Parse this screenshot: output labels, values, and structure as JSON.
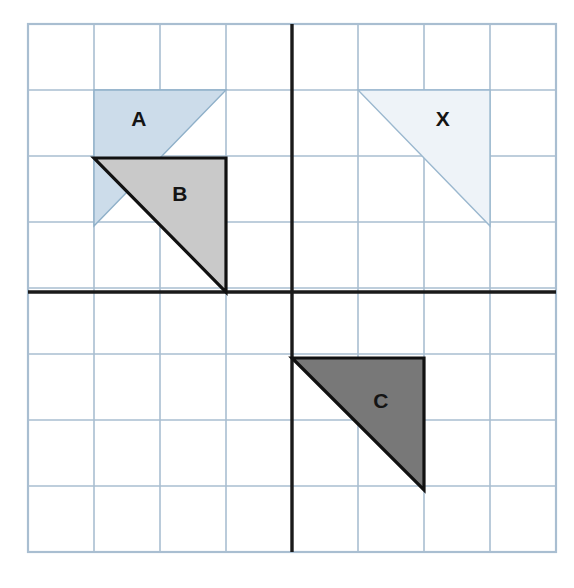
{
  "diagram": {
    "type": "geometry-grid",
    "grid": {
      "columns": 8,
      "rows": 8,
      "cell_size_px": 66,
      "left_px": 28,
      "top_px": 24,
      "right_px": 556,
      "bottom_px": 552,
      "origin_x_px": 292,
      "origin_y_px": 292,
      "grid_line_color": "#a9bed1",
      "axis_color": "#1a1a1a",
      "border_color": "#a9bed1",
      "background_color": "#ffffff",
      "x_range": [
        -4,
        4
      ],
      "y_range": [
        -4,
        4
      ]
    },
    "shapes": [
      {
        "id": "triangle-a",
        "label": "A",
        "fill": "#ccdcea",
        "stroke": "#8fb0c9",
        "stroke_width": 1.4,
        "label_px": [
          139,
          118
        ],
        "vertices_px": [
          [
            94,
            90
          ],
          [
            226,
            90
          ],
          [
            94,
            226
          ]
        ],
        "vertices_grid": [
          [
            -3,
            3
          ],
          [
            -1,
            3
          ],
          [
            -3,
            1
          ]
        ],
        "right_angle_at": "top-left"
      },
      {
        "id": "triangle-x",
        "label": "X",
        "fill": "#eef3f8",
        "stroke": "#9bb8cf",
        "stroke_width": 1.4,
        "label_px": [
          443,
          118
        ],
        "vertices_px": [
          [
            358,
            90
          ],
          [
            490,
            90
          ],
          [
            490,
            226
          ]
        ],
        "vertices_grid": [
          [
            1,
            3
          ],
          [
            3,
            3
          ],
          [
            3,
            1
          ]
        ],
        "right_angle_at": "top-right"
      },
      {
        "id": "triangle-b",
        "label": "B",
        "fill": "#c9c9c9",
        "stroke": "#111111",
        "stroke_width": 3.2,
        "label_px": [
          180,
          193
        ],
        "vertices_px": [
          [
            94,
            158
          ],
          [
            226,
            158
          ],
          [
            226,
            292
          ]
        ],
        "vertices_grid": [
          [
            -3,
            2
          ],
          [
            -1,
            2
          ],
          [
            -1,
            0
          ]
        ],
        "right_angle_at": "top-right"
      },
      {
        "id": "triangle-c",
        "label": "C",
        "fill": "#787878",
        "stroke": "#111111",
        "stroke_width": 3.2,
        "label_px": [
          381,
          400
        ],
        "vertices_px": [
          [
            292,
            358
          ],
          [
            424,
            358
          ],
          [
            424,
            490
          ]
        ],
        "vertices_grid": [
          [
            0,
            -1
          ],
          [
            2,
            -1
          ],
          [
            2,
            -3
          ]
        ],
        "right_angle_at": "top-right"
      }
    ]
  }
}
